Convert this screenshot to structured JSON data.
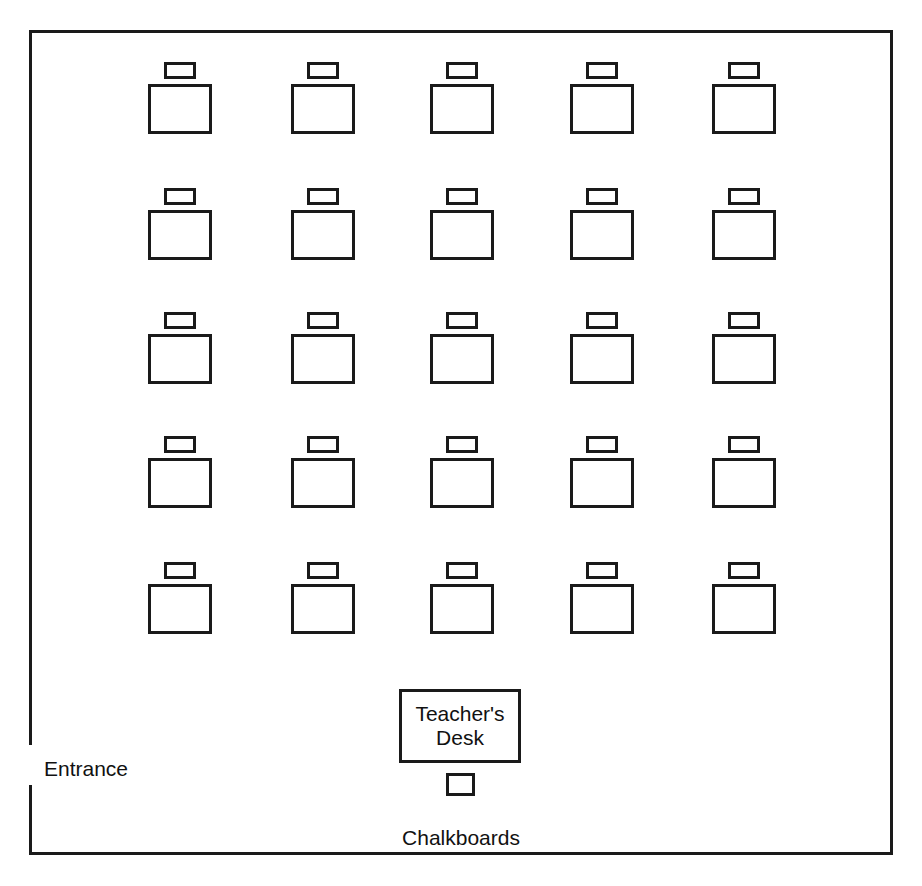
{
  "diagram": {
    "canvas": {
      "width": 922,
      "height": 886
    },
    "colors": {
      "background": "#ffffff",
      "line": "#1a1a1a",
      "text": "#111111"
    }
  },
  "room": {
    "outline": {
      "x": 29,
      "y": 30,
      "width": 864,
      "height": 825,
      "stroke_width": 3
    },
    "entrance_gap": {
      "wall": "left",
      "y_start": 745,
      "y_end": 785
    }
  },
  "labels": {
    "entrance": "Entrance",
    "chalkboards": "Chalkboards",
    "teacher_desk": "Teacher's\nDesk"
  },
  "seating": {
    "rows": 5,
    "columns": 5,
    "total_student_desks": 25,
    "desk_size": {
      "width": 64,
      "height": 50
    },
    "chair_size": {
      "width": 32,
      "height": 17
    },
    "column_x": [
      148,
      291,
      430,
      570,
      712
    ],
    "row_y": [
      62,
      188,
      312,
      436,
      562
    ],
    "desks": [
      {
        "row": 1,
        "col": 1,
        "x": 148,
        "y": 62
      },
      {
        "row": 1,
        "col": 2,
        "x": 291,
        "y": 62
      },
      {
        "row": 1,
        "col": 3,
        "x": 430,
        "y": 62
      },
      {
        "row": 1,
        "col": 4,
        "x": 570,
        "y": 62
      },
      {
        "row": 1,
        "col": 5,
        "x": 712,
        "y": 62
      },
      {
        "row": 2,
        "col": 1,
        "x": 148,
        "y": 188
      },
      {
        "row": 2,
        "col": 2,
        "x": 291,
        "y": 188
      },
      {
        "row": 2,
        "col": 3,
        "x": 430,
        "y": 188
      },
      {
        "row": 2,
        "col": 4,
        "x": 570,
        "y": 188
      },
      {
        "row": 2,
        "col": 5,
        "x": 712,
        "y": 188
      },
      {
        "row": 3,
        "col": 1,
        "x": 148,
        "y": 312
      },
      {
        "row": 3,
        "col": 2,
        "x": 291,
        "y": 312
      },
      {
        "row": 3,
        "col": 3,
        "x": 430,
        "y": 312
      },
      {
        "row": 3,
        "col": 4,
        "x": 570,
        "y": 312
      },
      {
        "row": 3,
        "col": 5,
        "x": 712,
        "y": 312
      },
      {
        "row": 4,
        "col": 1,
        "x": 148,
        "y": 436
      },
      {
        "row": 4,
        "col": 2,
        "x": 291,
        "y": 436
      },
      {
        "row": 4,
        "col": 3,
        "x": 430,
        "y": 436
      },
      {
        "row": 4,
        "col": 4,
        "x": 570,
        "y": 436
      },
      {
        "row": 4,
        "col": 5,
        "x": 712,
        "y": 436
      },
      {
        "row": 5,
        "col": 1,
        "x": 148,
        "y": 562
      },
      {
        "row": 5,
        "col": 2,
        "x": 291,
        "y": 562
      },
      {
        "row": 5,
        "col": 3,
        "x": 430,
        "y": 562
      },
      {
        "row": 5,
        "col": 4,
        "x": 570,
        "y": 562
      },
      {
        "row": 5,
        "col": 5,
        "x": 712,
        "y": 562
      }
    ]
  },
  "teacher_area": {
    "desk": {
      "x": 399,
      "y": 689,
      "width": 122,
      "height": 74
    },
    "chair": {
      "x": 446,
      "y": 773,
      "width": 29,
      "height": 23
    }
  }
}
